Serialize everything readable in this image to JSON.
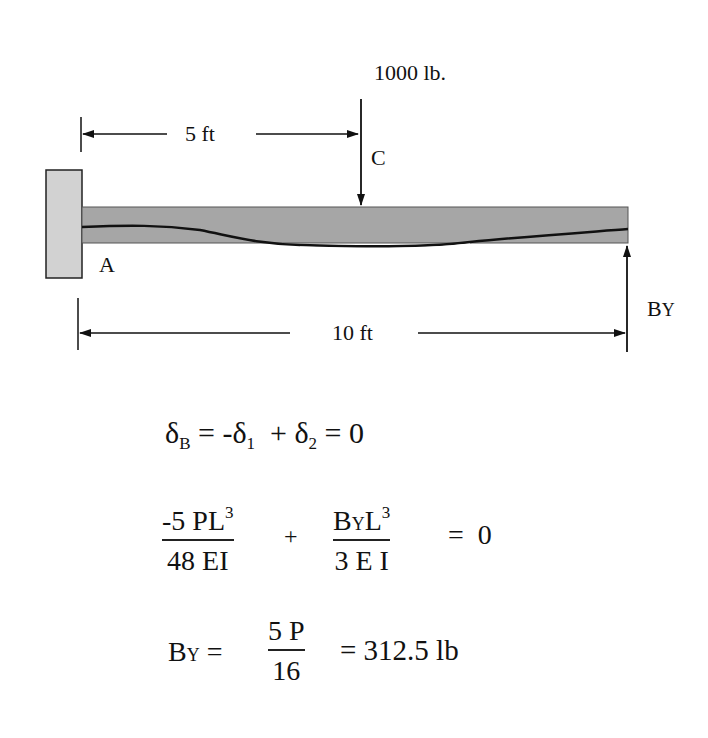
{
  "diagram": {
    "type": "propped cantilever beam with point load",
    "load_label": "1000 lb.",
    "point_load_label": "C",
    "fixed_end_label": "A",
    "reaction_label": {
      "main": "B",
      "sub": "Y"
    },
    "dim_half": "5 ft",
    "dim_full": "10 ft",
    "colors": {
      "beam_fill": "#a6a6a6",
      "wall_fill": "#d2d2d2",
      "line": "#111111",
      "background": "#ffffff"
    }
  },
  "equations": {
    "eq1": {
      "lhs_main": "δ",
      "lhs_sub": "B",
      "rest_a": " = -δ",
      "rest_a_sub": "1",
      "rest_b": "  + δ",
      "rest_b_sub": "2",
      "rest_c": " = 0"
    },
    "eq2": {
      "term1_num_a": "-5 PL",
      "term1_num_sup": "3",
      "term1_den": "48 EI",
      "plus": "+",
      "term2_num_a": "B",
      "term2_num_sub": "Y",
      "term2_num_b": "L",
      "term2_num_sup": "3",
      "term2_den": "3 E I",
      "equals": "=  0"
    },
    "eq3": {
      "lhs_main": "B",
      "lhs_sub": "Y",
      "eq": " = ",
      "frac_num": "5 P",
      "frac_den": "16",
      "result": "= 312.5 lb"
    }
  }
}
